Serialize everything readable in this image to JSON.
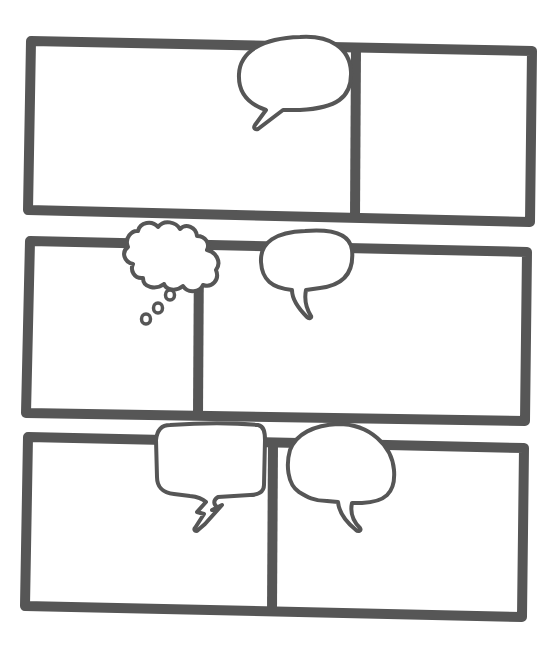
{
  "page": {
    "title": "Blank comic page template",
    "width": 556,
    "height": 648,
    "background": "#ffffff",
    "ink_color": "#565656",
    "frame_stroke_width": 10,
    "bubble_stroke_width": 4
  },
  "rows": [
    {
      "name": "row-1",
      "outer": [
        [
          31,
          41
        ],
        [
          532,
          51
        ],
        [
          530,
          222
        ],
        [
          28,
          210
        ]
      ],
      "dividers": [
        {
          "top": [
            356,
            46
          ],
          "bottom": [
            355,
            218
          ]
        }
      ],
      "panels": [
        {
          "name": "panel-1-left",
          "poly": [
            [
              31,
              41
            ],
            [
              356,
              46
            ],
            [
              355,
              218
            ],
            [
              28,
              210
            ]
          ]
        },
        {
          "name": "panel-1-right",
          "poly": [
            [
              356,
              46
            ],
            [
              532,
              51
            ],
            [
              530,
              222
            ],
            [
              355,
              218
            ]
          ]
        }
      ]
    },
    {
      "name": "row-2",
      "outer": [
        [
          30,
          241
        ],
        [
          527,
          252
        ],
        [
          525,
          421
        ],
        [
          26,
          413
        ]
      ],
      "dividers": [
        {
          "top": [
            199,
            245
          ],
          "bottom": [
            198,
            416
          ]
        }
      ],
      "panels": [
        {
          "name": "panel-2-left",
          "poly": [
            [
              30,
              241
            ],
            [
              199,
              245
            ],
            [
              198,
              416
            ],
            [
              26,
              413
            ]
          ]
        },
        {
          "name": "panel-2-right",
          "poly": [
            [
              199,
              245
            ],
            [
              527,
              252
            ],
            [
              525,
              421
            ],
            [
              198,
              416
            ]
          ]
        }
      ]
    },
    {
      "name": "row-3",
      "outer": [
        [
          28,
          437
        ],
        [
          524,
          448
        ],
        [
          522,
          617
        ],
        [
          25,
          606
        ]
      ],
      "dividers": [
        {
          "top": [
            273,
            442
          ],
          "bottom": [
            272,
            612
          ]
        }
      ],
      "panels": [
        {
          "name": "panel-3-left",
          "poly": [
            [
              28,
              437
            ],
            [
              273,
              442
            ],
            [
              272,
              612
            ],
            [
              25,
              606
            ]
          ]
        },
        {
          "name": "panel-3-right",
          "poly": [
            [
              273,
              442
            ],
            [
              524,
              448
            ],
            [
              522,
              617
            ],
            [
              272,
              612
            ]
          ]
        }
      ]
    }
  ],
  "balloons": [
    {
      "name": "speech-bubble-1",
      "kind": "speech",
      "path": "M 300 37 C 330 35 350 48 351 72 C 352 98 336 108 300 110 L 283 110 L 258 129 C 255 130 253 128 255 125 L 266 110 C 248 104 238 92 239 74 C 240 52 262 38 300 37 Z"
    },
    {
      "name": "thought-bubble-1",
      "kind": "thought",
      "path": "M 138 231 C 140 222 152 220 158 227 C 164 219 176 222 180 229 C 186 223 196 227 197 236 C 206 236 210 244 207 250 C 216 252 222 262 216 270 C 220 280 212 288 203 285 C 200 292 188 294 183 286 C 176 292 166 290 164 284 C 156 290 143 288 143 278 C 134 279 130 270 133 264 C 124 262 121 252 128 247 C 124 238 132 230 138 231 Z",
      "dots": [
        {
          "cx": 170,
          "cy": 295,
          "rx": 4.5,
          "ry": 5
        },
        {
          "cx": 158,
          "cy": 308,
          "rx": 4.5,
          "ry": 5
        },
        {
          "cx": 146,
          "cy": 319,
          "rx": 4.5,
          "ry": 5
        }
      ]
    },
    {
      "name": "speech-bubble-2",
      "kind": "speech",
      "path": "M 305 231 C 330 229 350 233 352 250 C 354 270 346 285 320 288 L 306 290 C 304 300 306 308 311 316 C 312 318 309 319 307 317 C 298 308 292 298 292 290 C 272 288 262 280 261 262 C 260 242 276 232 305 231 Z"
    },
    {
      "name": "speech-bubble-3",
      "kind": "speech-jagged",
      "path": "M 170 425 C 200 423 235 423 258 425 C 264 426 265 432 265 440 L 264 485 C 264 492 258 495 250 495 L 218 497 C 213 500 213 504 218 508 L 212 510 L 222 505 L 205 524 L 198 530 C 196 532 193 530 195 528 L 204 514 L 197 512 L 206 502 C 204 500 200 497 190 496 L 174 494 C 162 493 157 486 157 477 L 156 440 C 157 430 162 425 170 425 Z"
    },
    {
      "name": "speech-bubble-4",
      "kind": "speech",
      "path": "M 338 424 C 370 424 392 446 394 470 C 396 494 384 502 362 503 L 352 503 C 350 512 352 520 360 528 C 362 531 358 532 356 530 C 346 522 339 512 338 502 L 327 501 C 314 501 307 497 299 492 C 287 484 286 464 290 450 C 296 434 314 425 338 424 Z"
    }
  ]
}
